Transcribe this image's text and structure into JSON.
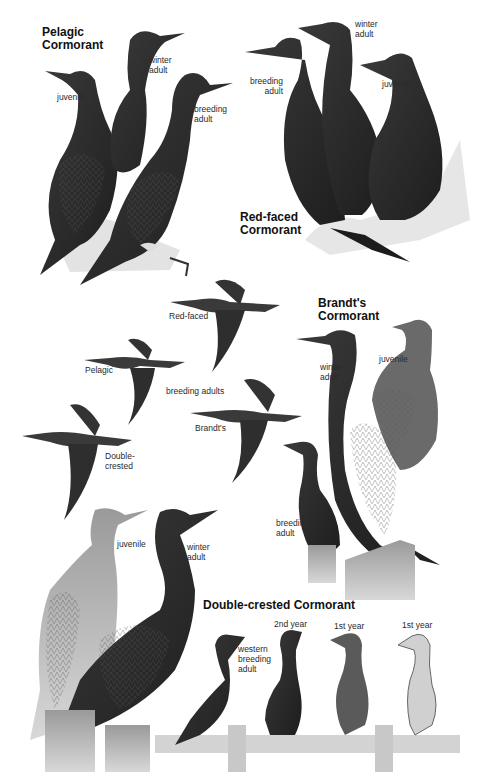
{
  "plate": {
    "subject": "Cormorants field guide plate",
    "species": [
      {
        "title": "Pelagic\nCormorant",
        "labels": [
          "juvenile",
          "winter\nadult",
          "breeding\nadult"
        ]
      },
      {
        "title": "Red-faced\nCormorant",
        "labels": [
          "breeding\nadult",
          "winter\nadult",
          "juvenile"
        ]
      },
      {
        "title": "Brandt's\nCormorant",
        "labels": [
          "winter\nadult",
          "juvenile",
          "breeding\nadult"
        ]
      },
      {
        "title": "Double-crested Cormorant",
        "labels": [
          "juvenile",
          "winter\nadult",
          "western\nbreeding\nadult",
          "2nd year",
          "1st year",
          "1st year"
        ]
      }
    ],
    "flight": {
      "caption": "breeding adults",
      "labels": [
        "Red-faced",
        "Pelagic",
        "Brandt's",
        "Double-\ncrested"
      ]
    }
  },
  "colors": {
    "background": "#ffffff",
    "bird_dark": "#2b2b2b",
    "bird_mid": "#4a4a4a",
    "bird_light": "#bdbdbd",
    "rock": "#d9d9d9",
    "wood": "#cfcfcf",
    "text": "#2a2a2a"
  }
}
